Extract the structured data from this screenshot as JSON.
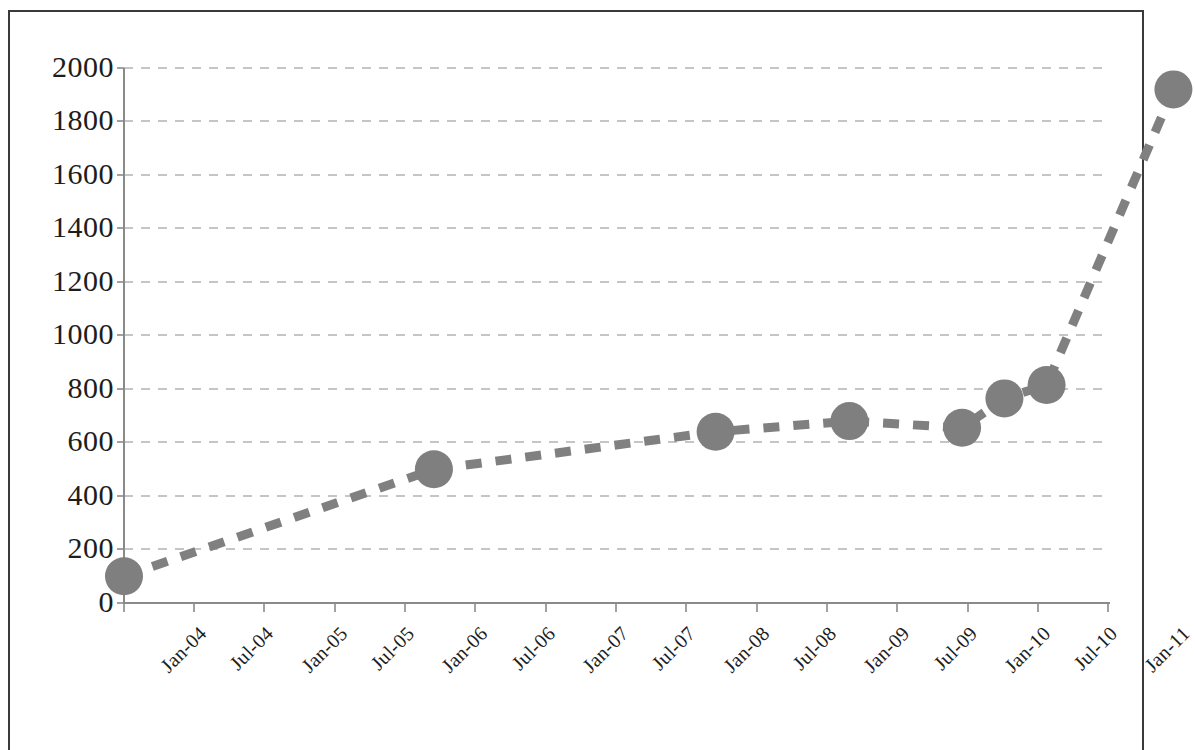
{
  "chart_data": {
    "type": "line",
    "title": "",
    "subtitle": "",
    "xlabel": "",
    "ylabel": "",
    "grid": true,
    "grid_axis": "y",
    "legend": false,
    "legend_position": "none",
    "line_style": "dashed",
    "marker": "circle",
    "line_color": "#808080",
    "marker_color": "#7f7f7f",
    "ylim": [
      0,
      2000
    ],
    "ytick_labels": [
      "2000",
      "1800",
      "1600",
      "1400",
      "1200",
      "1000",
      "800",
      "600",
      "400",
      "200",
      "0"
    ],
    "ytick_values": [
      2000,
      1800,
      1600,
      1400,
      1200,
      1000,
      800,
      600,
      400,
      200,
      0
    ],
    "xtick_labels": [
      "Jan-04",
      "Jul-04",
      "Jan-05",
      "Jul-05",
      "Jan-06",
      "Jul-06",
      "Jan-07",
      "Jul-07",
      "Jan-08",
      "Jul-08",
      "Jan-09",
      "Jul-09",
      "Jan-10",
      "Jul-10",
      "Jan-11"
    ],
    "categories": [
      "Jan-04",
      "Apr-06",
      "Apr-08",
      "Feb-09",
      "Dec-09",
      "Apr-10",
      "Jul-10",
      "Jan-11"
    ],
    "points": [
      {
        "x": "Jan-04",
        "x_index": 0.0,
        "y": 100
      },
      {
        "x": "Apr-06",
        "x_index": 4.4,
        "y": 500
      },
      {
        "x": "Apr-08",
        "x_index": 8.4,
        "y": 640
      },
      {
        "x": "Feb-09",
        "x_index": 10.3,
        "y": 680
      },
      {
        "x": "Dec-09",
        "x_index": 11.9,
        "y": 655
      },
      {
        "x": "Apr-10",
        "x_index": 12.5,
        "y": 765
      },
      {
        "x": "Jul-10",
        "x_index": 13.1,
        "y": 815
      },
      {
        "x": "Jan-11",
        "x_index": 14.9,
        "y": 1920
      }
    ],
    "values": [
      100,
      500,
      640,
      680,
      655,
      765,
      815,
      1920
    ]
  }
}
